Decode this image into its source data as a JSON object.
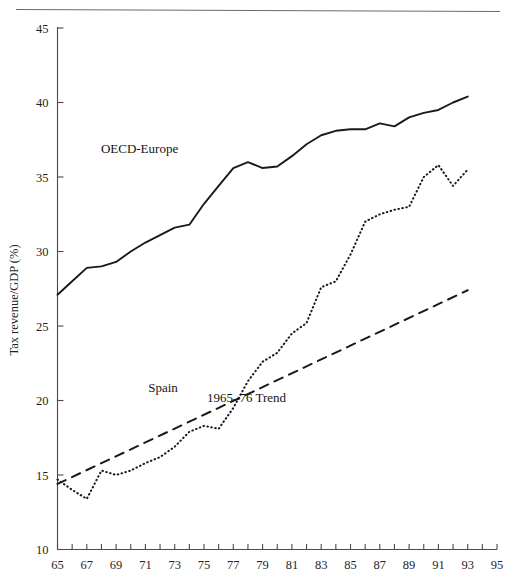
{
  "figure": {
    "top_rule": true,
    "background_color": "#ffffff",
    "ink_color": "#1a1a1a"
  },
  "labels": {
    "y_axis_title": "Tax revenue/GDP (%)",
    "series_oecd": "OECD-Europe",
    "series_spain": "Spain",
    "series_trend": "1965–76 Trend"
  },
  "chart_data": {
    "type": "line",
    "title": "",
    "xlabel": "",
    "ylabel": "Tax revenue/GDP (%)",
    "xlim": [
      65,
      95
    ],
    "ylim": [
      10,
      45
    ],
    "grid": false,
    "legend_position": "inline-annotations",
    "x_tick_labels": [
      "65",
      "67",
      "69",
      "71",
      "73",
      "75",
      "77",
      "79",
      "81",
      "83",
      "85",
      "87",
      "89",
      "91",
      "93",
      "95"
    ],
    "x_tick_values": [
      65,
      67,
      69,
      71,
      73,
      75,
      77,
      79,
      81,
      83,
      85,
      87,
      89,
      91,
      93,
      95
    ],
    "x_minor_tick_values": [
      65,
      66,
      67,
      68,
      69,
      70,
      71,
      72,
      73,
      74,
      75,
      76,
      77,
      78,
      79,
      80,
      81,
      82,
      83,
      84,
      85,
      86,
      87,
      88,
      89,
      90,
      91,
      92,
      93,
      94,
      95
    ],
    "y_tick_labels": [
      "10",
      "15",
      "20",
      "25",
      "30",
      "35",
      "40",
      "45"
    ],
    "y_tick_values": [
      10,
      15,
      20,
      25,
      30,
      35,
      40,
      45
    ],
    "x": [
      65,
      66,
      67,
      68,
      69,
      70,
      71,
      72,
      73,
      74,
      75,
      76,
      77,
      78,
      79,
      80,
      81,
      82,
      83,
      84,
      85,
      86,
      87,
      88,
      89,
      90,
      91,
      92,
      93
    ],
    "series": [
      {
        "name": "OECD-Europe",
        "style": "solid",
        "label_position": {
          "x": 70.6,
          "y": 36.6
        },
        "x": [
          65,
          66,
          67,
          68,
          69,
          70,
          71,
          72,
          73,
          74,
          75,
          76,
          77,
          78,
          79,
          80,
          81,
          82,
          83,
          84,
          85,
          86,
          87,
          88,
          89,
          90,
          91,
          92,
          93
        ],
        "values": [
          27.1,
          28.0,
          28.9,
          29.0,
          29.3,
          30.0,
          30.6,
          31.1,
          31.6,
          31.8,
          33.2,
          34.4,
          35.6,
          36.0,
          35.6,
          35.7,
          36.4,
          37.2,
          37.8,
          38.1,
          38.2,
          38.2,
          38.6,
          38.4,
          39.0,
          39.3,
          39.5,
          40.0,
          40.4
        ]
      },
      {
        "name": "Spain",
        "style": "dotted",
        "label_position": {
          "x": 72.2,
          "y": 20.6
        },
        "x": [
          65,
          66,
          67,
          68,
          69,
          70,
          71,
          72,
          73,
          74,
          75,
          76,
          77,
          78,
          79,
          80,
          81,
          82,
          83,
          84,
          85,
          86,
          87,
          88,
          89,
          90,
          91,
          92,
          93
        ],
        "values": [
          14.7,
          14.0,
          13.4,
          15.3,
          15.0,
          15.3,
          15.8,
          16.2,
          16.9,
          17.9,
          18.3,
          18.1,
          19.5,
          21.3,
          22.6,
          23.2,
          24.5,
          25.2,
          27.6,
          28.0,
          29.8,
          32.0,
          32.5,
          32.8,
          33.0,
          35.0,
          35.8,
          34.4,
          35.5
        ]
      },
      {
        "name": "1965–76 Trend",
        "style": "dashed",
        "label_position": {
          "x": 77.9,
          "y": 19.9
        },
        "x": [
          65,
          93
        ],
        "values": [
          14.4,
          27.4
        ]
      }
    ]
  }
}
